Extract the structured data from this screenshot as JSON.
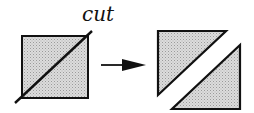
{
  "diagram": {
    "cut_label": "cut",
    "colors": {
      "stroke": "#111111",
      "fill": "#d4d4d4",
      "background": "#ffffff"
    },
    "shapes": [
      "square-with-diagonal-cut",
      "arrow-right",
      "upper-left-triangle",
      "lower-right-triangle"
    ]
  }
}
